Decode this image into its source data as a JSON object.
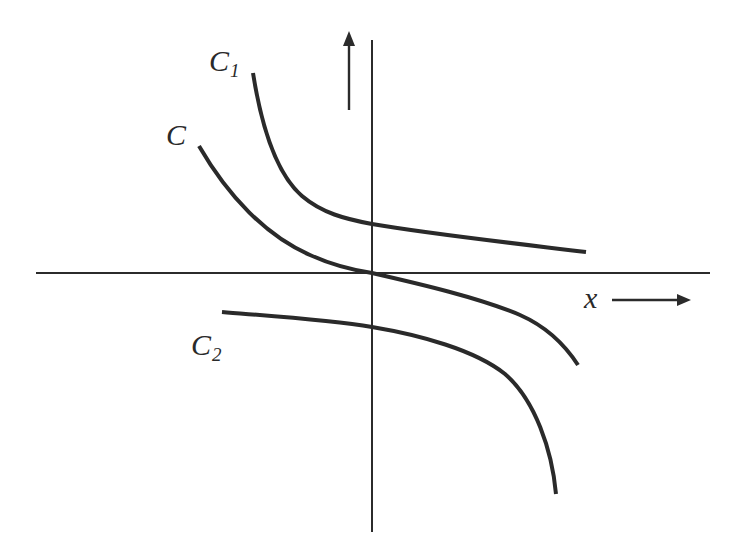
{
  "diagram": {
    "type": "family-of-curves-sketch",
    "axes": {
      "x_label": "x",
      "y_arrow": "up",
      "x_arrow": "right"
    },
    "curves": [
      {
        "id": "C1",
        "label_main": "C",
        "label_sub": "1",
        "position": "above origin"
      },
      {
        "id": "C",
        "label_main": "C",
        "label_sub": "",
        "position": "through origin"
      },
      {
        "id": "C2",
        "label_main": "C",
        "label_sub": "2",
        "position": "below origin"
      }
    ],
    "colors": {
      "ink": "#2a2a2a",
      "background": "#ffffff"
    }
  }
}
